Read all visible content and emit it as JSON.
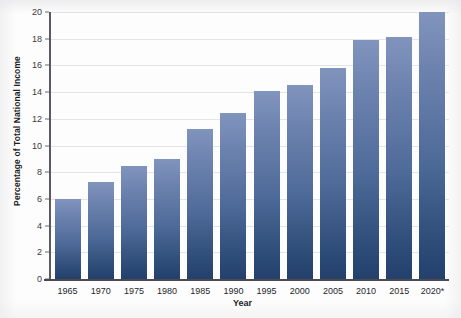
{
  "chart_data": {
    "type": "bar",
    "title": "",
    "subtitle": "",
    "xlabel": "Year",
    "ylabel": "Percentage of Total National Income",
    "categories": [
      "1965",
      "1970",
      "1975",
      "1980",
      "1985",
      "1990",
      "1995",
      "2000",
      "2005",
      "2010",
      "2015",
      "2020*"
    ],
    "values": [
      6.0,
      7.3,
      8.5,
      9.0,
      11.2,
      12.4,
      14.1,
      14.5,
      15.8,
      17.9,
      18.1,
      20.0
    ],
    "ylim": [
      0,
      20
    ],
    "yticks": [
      0,
      2,
      4,
      6,
      8,
      10,
      12,
      14,
      16,
      18,
      20
    ],
    "ytick_labels": [
      "0",
      "2",
      "4",
      "6",
      "8",
      "10",
      "12",
      "14",
      "16",
      "18",
      "20"
    ],
    "grid": "horizontal",
    "legend": "none",
    "bar_color_top": "#8094bd",
    "bar_color_bottom": "#24406c",
    "gridline_color": "#e2e4e8",
    "axis_color": "#5a5a60",
    "annotations": [
      "* projected, indicated by asterisk on 2020 label"
    ]
  }
}
